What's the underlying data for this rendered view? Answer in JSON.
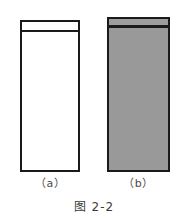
{
  "figure": {
    "caption": "图 2-2",
    "background_color": "#ffffff",
    "outline_color": "#1a1a1a",
    "panels": [
      {
        "key": "a",
        "label": "（a）",
        "fill_color": "#ffffff",
        "band_fill_color": "#ffffff",
        "description": "unfilled rectangle with thin empty band at top"
      },
      {
        "key": "b",
        "label": "（b）",
        "fill_color": "#999999",
        "band_fill_color": "#9d9d9d",
        "description": "gray filled rectangle with gray band at top"
      }
    ]
  }
}
